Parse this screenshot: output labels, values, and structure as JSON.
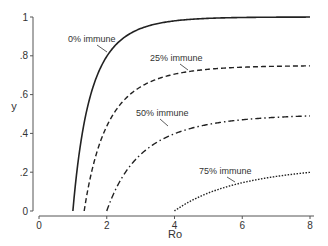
{
  "chart_data": {
    "type": "line",
    "title": "",
    "xlabel": "Ro",
    "ylabel": "y",
    "xlim": [
      0,
      8
    ],
    "ylim": [
      0,
      1
    ],
    "x_ticks": [
      "0",
      "2",
      "4",
      "6",
      "8"
    ],
    "y_ticks": [
      "0",
      ".2",
      ".4",
      ".6",
      ".8",
      "1"
    ],
    "grid": false,
    "legend": "none (inline curve labels)",
    "series": [
      {
        "name": "0% immune",
        "immune": 0.0,
        "style": "solid",
        "x": [
          1,
          1.5,
          2,
          3,
          4,
          5,
          6,
          8
        ],
        "values": [
          0,
          0.58,
          0.8,
          0.94,
          0.98,
          0.99,
          1.0,
          1.0
        ]
      },
      {
        "name": "25% immune",
        "immune": 0.25,
        "style": "dashed",
        "x": [
          1.333,
          2,
          3,
          4,
          5,
          6,
          8
        ],
        "values": [
          0,
          0.44,
          0.62,
          0.7,
          0.73,
          0.74,
          0.75
        ]
      },
      {
        "name": "50% immune",
        "immune": 0.5,
        "style": "dash-dot",
        "x": [
          2,
          3,
          4,
          5,
          6,
          8
        ],
        "values": [
          0,
          0.29,
          0.4,
          0.45,
          0.47,
          0.5
        ]
      },
      {
        "name": "75% immune",
        "immune": 0.75,
        "style": "dotted",
        "x": [
          4,
          5,
          6,
          7,
          8
        ],
        "values": [
          0,
          0.09,
          0.14,
          0.17,
          0.2
        ]
      }
    ]
  }
}
